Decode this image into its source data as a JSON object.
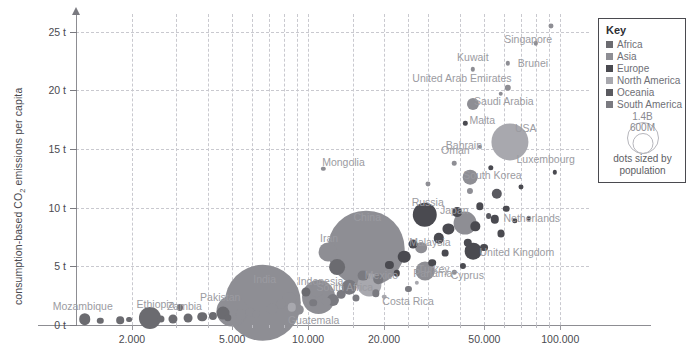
{
  "chart_data": {
    "type": "scatter",
    "title": "",
    "xlabel": "",
    "ylabel": "consumption-based CO2 emissions per capita",
    "ylabel_prefix": "consumption-based CO",
    "ylabel_sub": "2",
    "ylabel_suffix": " emissions per capita",
    "xscale": "log",
    "xlim": [
      1200,
      130000
    ],
    "ylim": [
      0,
      26.5
    ],
    "grid": true,
    "size_encoding": "population",
    "x_ticks": [
      {
        "value": 2000,
        "label": "2.000"
      },
      {
        "value": 5000,
        "label": "5.000"
      },
      {
        "value": 10000,
        "label": "10.000"
      },
      {
        "value": 20000,
        "label": "20.000"
      },
      {
        "value": 50000,
        "label": "50.000"
      },
      {
        "value": 100000,
        "label": "100.000"
      }
    ],
    "x_minor_ticks": [
      3000,
      4000,
      6000,
      7000,
      8000,
      9000,
      15000,
      25000,
      30000,
      40000,
      60000,
      70000,
      80000,
      90000
    ],
    "y_ticks": [
      {
        "value": 0,
        "label": "0 t"
      },
      {
        "value": 5,
        "label": "5 t"
      },
      {
        "value": 10,
        "label": "10 t"
      },
      {
        "value": 15,
        "label": "15 t"
      },
      {
        "value": 20,
        "label": "20 t"
      },
      {
        "value": 25,
        "label": "25 t"
      }
    ],
    "y_gridlines": [
      5,
      10,
      15,
      20,
      25
    ],
    "x_gridlines": [
      2000,
      5000,
      10000,
      20000,
      50000,
      100000,
      3000,
      4000,
      6000,
      7000,
      8000,
      9000,
      15000,
      25000,
      30000,
      40000,
      60000,
      70000,
      80000,
      90000
    ],
    "points": [
      {
        "name": "Mozambique",
        "x": 1300,
        "y": 0.5,
        "pop": 32,
        "region": "Africa",
        "label": true,
        "lx": -2,
        "ly": -13
      },
      {
        "name": "Ethiopia",
        "x": 2350,
        "y": 0.6,
        "pop": 118,
        "region": "Africa",
        "label": true,
        "lx": 6,
        "ly": -14
      },
      {
        "name": "Zambia",
        "x": 3350,
        "y": 0.6,
        "pop": 19,
        "region": "Africa",
        "label": true,
        "lx": -4,
        "ly": -12
      },
      {
        "name": "Pakistan",
        "x": 5000,
        "y": 1.2,
        "pop": 231,
        "region": "Asia",
        "label": true,
        "lx": -12,
        "ly": -14
      },
      {
        "name": "India",
        "x": 6600,
        "y": 1.9,
        "pop": 1400,
        "region": "Asia",
        "label": true,
        "lx": 2,
        "ly": -24
      },
      {
        "name": "Indonesia",
        "x": 11000,
        "y": 2.4,
        "pop": 276,
        "region": "Asia",
        "label": true,
        "lx": 2,
        "ly": -16
      },
      {
        "name": "Guatemala",
        "x": 8600,
        "y": 1.5,
        "pop": 17,
        "region": "North America",
        "label": true,
        "lx": 22,
        "ly": 13
      },
      {
        "name": "Mexico",
        "x": 17500,
        "y": 3.4,
        "pop": 130,
        "region": "North America",
        "label": true,
        "lx": 12,
        "ly": -10
      },
      {
        "name": "Panama",
        "x": 27000,
        "y": 3.6,
        "pop": 4,
        "region": "North America",
        "label": true,
        "lx": 16,
        "ly": -10
      },
      {
        "name": "Costa Rica",
        "x": 20000,
        "y": 2.4,
        "pop": 5,
        "region": "North America",
        "label": true,
        "lx": 24,
        "ly": 4
      },
      {
        "name": "South Africa",
        "x": 13000,
        "y": 4.9,
        "pop": 60,
        "region": "Africa",
        "label": true,
        "lx": 8,
        "ly": 20
      },
      {
        "name": "Iran",
        "x": 12000,
        "y": 6.2,
        "pop": 85,
        "region": "Asia",
        "label": true,
        "lx": 1,
        "ly": -14
      },
      {
        "name": "China",
        "x": 17000,
        "y": 6.5,
        "pop": 1412,
        "region": "Asia",
        "label": true,
        "lx": 1,
        "ly": -32
      },
      {
        "name": "Turkey",
        "x": 29000,
        "y": 4.6,
        "pop": 85,
        "region": "Asia",
        "label": true,
        "lx": 9,
        "ly": -2
      },
      {
        "name": "Malaysia",
        "x": 28000,
        "y": 6.6,
        "pop": 33,
        "region": "Asia",
        "label": true,
        "lx": 9,
        "ly": -6
      },
      {
        "name": "Cyprus",
        "x": 38000,
        "y": 4.5,
        "pop": 1,
        "region": "Asia",
        "label": true,
        "lx": 13,
        "ly": 3
      },
      {
        "name": "Russia",
        "x": 29000,
        "y": 9.4,
        "pop": 144,
        "region": "Europe",
        "label": true,
        "lx": 3,
        "ly": -13
      },
      {
        "name": "Japan",
        "x": 42000,
        "y": 8.7,
        "pop": 125,
        "region": "Asia",
        "label": true,
        "lx": -11,
        "ly": -13
      },
      {
        "name": "Netherlands",
        "x": 55000,
        "y": 9.0,
        "pop": 17,
        "region": "Europe",
        "label": true,
        "lx": 37,
        "ly": -1
      },
      {
        "name": "United Kingdom",
        "x": 45000,
        "y": 6.3,
        "pop": 67,
        "region": "Europe",
        "label": true,
        "lx": 44,
        "ly": 1
      },
      {
        "name": "South Korea",
        "x": 44000,
        "y": 12.6,
        "pop": 52,
        "region": "Asia",
        "label": true,
        "lx": 22,
        "ly": -2
      },
      {
        "name": "Luxembourg",
        "x": 95000,
        "y": 13.0,
        "pop": 1,
        "region": "Europe",
        "label": true,
        "lx": -9,
        "ly": -13
      },
      {
        "name": "Oman",
        "x": 38000,
        "y": 13.8,
        "pop": 5,
        "region": "Asia",
        "label": true,
        "lx": 1,
        "ly": -13
      },
      {
        "name": "Mongolia",
        "x": 11500,
        "y": 13.3,
        "pop": 3,
        "region": "Asia",
        "label": true,
        "lx": 20,
        "ly": -7
      },
      {
        "name": "Bahrain",
        "x": 48000,
        "y": 15.2,
        "pop": 2,
        "region": "Asia",
        "label": true,
        "lx": -16,
        "ly": -2
      },
      {
        "name": "USA",
        "x": 63000,
        "y": 15.6,
        "pop": 332,
        "region": "North America",
        "label": true,
        "lx": 16,
        "ly": -14
      },
      {
        "name": "Malta",
        "x": 42000,
        "y": 17.2,
        "pop": 1,
        "region": "Europe",
        "label": true,
        "lx": 17,
        "ly": -3
      },
      {
        "name": "Saudi Arabia",
        "x": 45000,
        "y": 18.8,
        "pop": 35,
        "region": "Asia",
        "label": true,
        "lx": 31,
        "ly": -3
      },
      {
        "name": "United Arab Emirates",
        "x": 62000,
        "y": 20.2,
        "pop": 10,
        "region": "Asia",
        "label": true,
        "lx": -46,
        "ly": -10
      },
      {
        "name": "Brunei",
        "x": 62000,
        "y": 22.3,
        "pop": 1,
        "region": "Asia",
        "label": true,
        "lx": 25,
        "ly": 0
      },
      {
        "name": "Kuwait",
        "x": 45000,
        "y": 21.8,
        "pop": 4,
        "region": "Asia",
        "label": true,
        "lx": 0,
        "ly": -12
      },
      {
        "name": "Singapore",
        "x": 92000,
        "y": 25.5,
        "pop": 6,
        "region": "Asia",
        "label": true,
        "lx": -23,
        "ly": 13
      },
      {
        "name": "dot1",
        "x": 1500,
        "y": 0.35,
        "pop": 10,
        "region": "Africa",
        "label": false
      },
      {
        "name": "dot2",
        "x": 1800,
        "y": 0.4,
        "pop": 14,
        "region": "Africa",
        "label": false
      },
      {
        "name": "dot3",
        "x": 1950,
        "y": 0.45,
        "pop": 8,
        "region": "Africa",
        "label": false
      },
      {
        "name": "dot4",
        "x": 2600,
        "y": 0.5,
        "pop": 12,
        "region": "Africa",
        "label": false
      },
      {
        "name": "dot5",
        "x": 2900,
        "y": 0.55,
        "pop": 20,
        "region": "Africa",
        "label": false
      },
      {
        "name": "dot6",
        "x": 3800,
        "y": 0.7,
        "pop": 22,
        "region": "Africa",
        "label": false
      },
      {
        "name": "dot7",
        "x": 4200,
        "y": 0.8,
        "pop": 16,
        "region": "Africa",
        "label": false
      },
      {
        "name": "dot8",
        "x": 4600,
        "y": 1.0,
        "pop": 40,
        "region": "Africa",
        "label": false
      },
      {
        "name": "dot9",
        "x": 3100,
        "y": 1.5,
        "pop": 9,
        "region": "Africa",
        "label": false
      },
      {
        "name": "dot10",
        "x": 5400,
        "y": 0.9,
        "pop": 25,
        "region": "Asia",
        "label": false
      },
      {
        "name": "dot11",
        "x": 5900,
        "y": 1.1,
        "pop": 18,
        "region": "Asia",
        "label": false
      },
      {
        "name": "dot12",
        "x": 7200,
        "y": 1.4,
        "pop": 30,
        "region": "Asia",
        "label": false
      },
      {
        "name": "dot13",
        "x": 7800,
        "y": 1.8,
        "pop": 24,
        "region": "Asia",
        "label": false
      },
      {
        "name": "dot14",
        "x": 8400,
        "y": 2.2,
        "pop": 45,
        "region": "Asia",
        "label": false
      },
      {
        "name": "dot15",
        "x": 9200,
        "y": 1.3,
        "pop": 26,
        "region": "Asia",
        "label": false
      },
      {
        "name": "dot16",
        "x": 9800,
        "y": 2.8,
        "pop": 20,
        "region": "Africa",
        "label": false
      },
      {
        "name": "dot17",
        "x": 10500,
        "y": 1.9,
        "pop": 14,
        "region": "South America",
        "label": false
      },
      {
        "name": "dot18",
        "x": 12500,
        "y": 2.1,
        "pop": 35,
        "region": "South America",
        "label": false
      },
      {
        "name": "dot19",
        "x": 13500,
        "y": 2.6,
        "pop": 18,
        "region": "South America",
        "label": false
      },
      {
        "name": "dot20",
        "x": 14500,
        "y": 3.2,
        "pop": 52,
        "region": "South America",
        "label": false
      },
      {
        "name": "dot21",
        "x": 15500,
        "y": 2.3,
        "pop": 12,
        "region": "South America",
        "label": false
      },
      {
        "name": "dot22",
        "x": 16500,
        "y": 4.2,
        "pop": 28,
        "region": "South America",
        "label": false
      },
      {
        "name": "dot23",
        "x": 19000,
        "y": 3.9,
        "pop": 22,
        "region": "South America",
        "label": false
      },
      {
        "name": "dot24",
        "x": 21000,
        "y": 5.1,
        "pop": 16,
        "region": "Europe",
        "label": false
      },
      {
        "name": "dot25",
        "x": 22500,
        "y": 4.4,
        "pop": 10,
        "region": "Europe",
        "label": false
      },
      {
        "name": "dot26",
        "x": 24000,
        "y": 5.8,
        "pop": 38,
        "region": "Europe",
        "label": false
      },
      {
        "name": "dot27",
        "x": 26000,
        "y": 6.9,
        "pop": 19,
        "region": "Europe",
        "label": false
      },
      {
        "name": "dot28",
        "x": 31000,
        "y": 5.3,
        "pop": 14,
        "region": "Europe",
        "label": false
      },
      {
        "name": "dot29",
        "x": 33000,
        "y": 7.4,
        "pop": 26,
        "region": "Europe",
        "label": false
      },
      {
        "name": "dot30",
        "x": 35000,
        "y": 6.1,
        "pop": 11,
        "region": "Europe",
        "label": false
      },
      {
        "name": "dot31",
        "x": 36000,
        "y": 8.2,
        "pop": 30,
        "region": "Europe",
        "label": false
      },
      {
        "name": "dot32",
        "x": 39000,
        "y": 9.6,
        "pop": 23,
        "region": "Europe",
        "label": false
      },
      {
        "name": "dot33",
        "x": 41000,
        "y": 5.0,
        "pop": 9,
        "region": "Europe",
        "label": false
      },
      {
        "name": "dot34",
        "x": 43000,
        "y": 7.0,
        "pop": 17,
        "region": "Europe",
        "label": false
      },
      {
        "name": "dot35",
        "x": 46000,
        "y": 8.4,
        "pop": 21,
        "region": "Europe",
        "label": false
      },
      {
        "name": "dot36",
        "x": 48000,
        "y": 10.1,
        "pop": 13,
        "region": "Europe",
        "label": false
      },
      {
        "name": "dot37",
        "x": 50000,
        "y": 6.6,
        "pop": 15,
        "region": "Europe",
        "label": false
      },
      {
        "name": "dot38",
        "x": 52000,
        "y": 9.3,
        "pop": 8,
        "region": "Oceania",
        "label": false
      },
      {
        "name": "dot39",
        "x": 56000,
        "y": 11.2,
        "pop": 26,
        "region": "Oceania",
        "label": false
      },
      {
        "name": "dot40",
        "x": 58000,
        "y": 7.8,
        "pop": 12,
        "region": "Europe",
        "label": false
      },
      {
        "name": "dot41",
        "x": 61000,
        "y": 9.9,
        "pop": 10,
        "region": "Europe",
        "label": false
      },
      {
        "name": "dot42",
        "x": 66000,
        "y": 8.9,
        "pop": 7,
        "region": "Europe",
        "label": false
      },
      {
        "name": "dot43",
        "x": 70000,
        "y": 11.8,
        "pop": 6,
        "region": "Europe",
        "label": false
      },
      {
        "name": "dot44",
        "x": 75000,
        "y": 9.1,
        "pop": 5,
        "region": "Europe",
        "label": false
      },
      {
        "name": "dot45",
        "x": 44000,
        "y": 11.4,
        "pop": 9,
        "region": "Asia",
        "label": false
      },
      {
        "name": "dot46",
        "x": 30000,
        "y": 12.0,
        "pop": 6,
        "region": "Asia",
        "label": false
      },
      {
        "name": "dot47",
        "x": 53000,
        "y": 13.4,
        "pop": 7,
        "region": "Europe",
        "label": false
      },
      {
        "name": "dot48",
        "x": 80000,
        "y": 24.0,
        "pop": 4,
        "region": "Asia",
        "label": false
      },
      {
        "name": "dot49",
        "x": 58000,
        "y": 19.7,
        "pop": 5,
        "region": "Asia",
        "label": false
      },
      {
        "name": "dot50",
        "x": 6200,
        "y": 0.9,
        "pop": 11,
        "region": "Asia",
        "label": false
      },
      {
        "name": "dot51",
        "x": 4800,
        "y": 0.6,
        "pop": 13,
        "region": "Africa",
        "label": false
      },
      {
        "name": "dot52",
        "x": 10800,
        "y": 2.9,
        "pop": 44,
        "region": "Asia",
        "label": false
      },
      {
        "name": "dot53",
        "x": 11800,
        "y": 2.0,
        "pop": 17,
        "region": "Asia",
        "label": false
      },
      {
        "name": "dot54",
        "x": 18500,
        "y": 2.7,
        "pop": 13,
        "region": "South America",
        "label": false
      },
      {
        "name": "dot55",
        "x": 25000,
        "y": 3.1,
        "pop": 9,
        "region": "South America",
        "label": false
      }
    ]
  },
  "legend": {
    "title": "Key",
    "entries": [
      {
        "label": "Africa",
        "color": "#6b6b70"
      },
      {
        "label": "Asia",
        "color": "#8e8e94"
      },
      {
        "label": "Europe",
        "color": "#4a4a50"
      },
      {
        "label": "North America",
        "color": "#a8a8ae"
      },
      {
        "label": "Oceania",
        "color": "#5a5a60"
      },
      {
        "label": "South America",
        "color": "#7a7a80"
      }
    ],
    "bubble_large_label": "1.4B",
    "bubble_small_label": "600M",
    "note_line1": "dots sized by",
    "note_line2": "population"
  }
}
